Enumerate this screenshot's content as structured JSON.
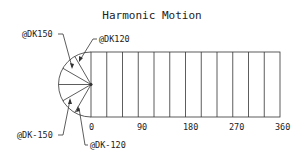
{
  "title": "Harmonic Motion",
  "x_ticks": [
    "0",
    "90",
    "180",
    "270",
    "360"
  ],
  "callouts": {
    "c150": "@DK150",
    "c120": "@DK120",
    "cm150": "@DK-150",
    "cm120": "@DK-120"
  },
  "colors": {
    "line": "#333333",
    "background": "#ffffff"
  }
}
